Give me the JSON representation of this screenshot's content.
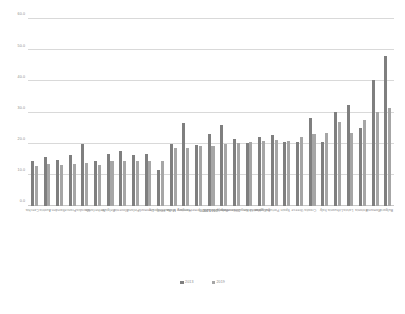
{
  "chart_data": {
    "type": "bar",
    "title": "",
    "subtitle": "",
    "xlabel": "",
    "ylabel": "",
    "ylim": [
      0,
      60
    ],
    "yticks": [
      "0.0",
      "10.0",
      "20.0",
      "30.0",
      "40.0",
      "50.0",
      "60.0"
    ],
    "grid": true,
    "legend_position": "bottom",
    "categories": [
      "Czechia",
      "Austria",
      "Sweden",
      "France",
      "Slovakia",
      "Netherlands",
      "Belgium",
      "Slovenia",
      "Finland",
      "Denmark",
      "Luxembourg",
      "Malta",
      "Hungary",
      "Germany (until 1990 former territory of the FRG)",
      "Ireland",
      "Poland",
      "European Union - 28 countries (2013-2020)",
      "United Kingdom",
      "Cyprus",
      "Portugal",
      "Spain",
      "Greece",
      "Croatia",
      "Italy",
      "Lithuania",
      "Latvia",
      "Estonia",
      "Romania",
      "Bulgaria"
    ],
    "series": [
      {
        "name": "2013",
        "values": [
          14.6,
          15.6,
          14.9,
          16.4,
          19.8,
          14.5,
          16.8,
          17.6,
          16.4,
          16.8,
          11.4,
          19.9,
          26.7,
          19.6,
          23.1,
          26.0,
          21.6,
          20.3,
          22.2,
          22.8,
          20.7,
          20.5,
          28.3,
          20.4,
          30.1,
          32.3,
          24.9,
          40.4,
          48.0
        ]
      },
      {
        "name": "2019",
        "values": [
          12.8,
          13.4,
          13.3,
          13.6,
          13.9,
          13.3,
          14.4,
          14.4,
          14.3,
          14.4,
          14.5,
          18.7,
          18.7,
          19.4,
          19.4,
          19.8,
          20.2,
          20.4,
          20.8,
          21.1,
          20.8,
          22.2,
          23.0,
          23.4,
          27.0,
          23.3,
          27.7,
          30.3,
          31.4
        ]
      }
    ]
  }
}
